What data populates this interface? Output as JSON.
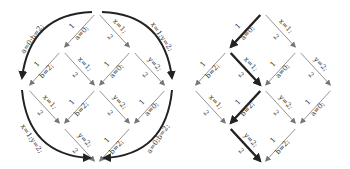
{
  "left_diagram": {
    "description": "Diamond interleaving lattice with four curved arrows around it",
    "edges": [
      {
        "from": "top",
        "to": "r1l",
        "stmt": "a=0;",
        "thread": "1"
      },
      {
        "from": "top",
        "to": "r1r",
        "stmt": "x=1;",
        "thread": "2"
      },
      {
        "from": "r1l",
        "to": "r2l",
        "stmt": "b=2;",
        "thread": "1"
      },
      {
        "from": "r1l",
        "to": "r2m",
        "stmt": "x=1;",
        "thread": "2"
      },
      {
        "from": "r1r",
        "to": "r2m",
        "stmt": "a=0;",
        "thread": "1"
      },
      {
        "from": "r1r",
        "to": "r2r",
        "stmt": "y=2;",
        "thread": "2"
      },
      {
        "from": "r2l",
        "to": "r3l",
        "stmt": "x=1;",
        "thread": "2"
      },
      {
        "from": "r2m",
        "to": "r3l",
        "stmt": "b=2;",
        "thread": "1"
      },
      {
        "from": "r2m",
        "to": "r3r",
        "stmt": "y=2;",
        "thread": "2"
      },
      {
        "from": "r2r",
        "to": "r3r",
        "stmt": "a=0;",
        "thread": "1"
      },
      {
        "from": "r3l",
        "to": "bot",
        "stmt": "y=2;",
        "thread": "2"
      },
      {
        "from": "r3r",
        "to": "bot",
        "stmt": "b=2;",
        "thread": "1"
      }
    ],
    "arcs": [
      {
        "label": "a=0;b=2;",
        "position": "top-left"
      },
      {
        "label": "x=1;y=2;",
        "position": "top-right"
      },
      {
        "label": "x=1;y=2;",
        "position": "bottom-left"
      },
      {
        "label": "a=0;b=2;",
        "position": "bottom-right"
      }
    ]
  },
  "right_diagram": {
    "description": "Same lattice with one highlighted execution path (bold arrows)",
    "edges": [
      {
        "stmt": "a=0;",
        "thread": "1",
        "bold": true
      },
      {
        "stmt": "x=1;",
        "thread": "2",
        "bold": false
      },
      {
        "stmt": "b=2;",
        "thread": "1",
        "bold": false
      },
      {
        "stmt": "x=1;",
        "thread": "2",
        "bold": true
      },
      {
        "stmt": "a=0;",
        "thread": "1",
        "bold": false
      },
      {
        "stmt": "y=2;",
        "thread": "2",
        "bold": false
      },
      {
        "stmt": "x=1;",
        "thread": "2",
        "bold": false
      },
      {
        "stmt": "b=2;",
        "thread": "1",
        "bold": true
      },
      {
        "stmt": "y=2;",
        "thread": "2",
        "bold": false
      },
      {
        "stmt": "a=0;",
        "thread": "1",
        "bold": false
      },
      {
        "stmt": "y=2;",
        "thread": "2",
        "bold": true
      },
      {
        "stmt": "b=2;",
        "thread": "1",
        "bold": false
      }
    ]
  }
}
